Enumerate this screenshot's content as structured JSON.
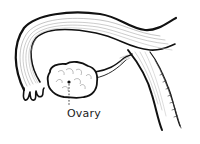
{
  "diagram": {
    "style": "black-and-white line illustration",
    "labels": [
      {
        "text": "Ovary",
        "points_to": "ovary"
      }
    ],
    "parts": [
      "fallopian-tube",
      "fimbriae",
      "ovary",
      "ovarian-ligament",
      "uterus-wall"
    ],
    "colors": {
      "stroke": "#111111",
      "fine_stroke": "#8a8a8a",
      "background": "#ffffff"
    }
  }
}
